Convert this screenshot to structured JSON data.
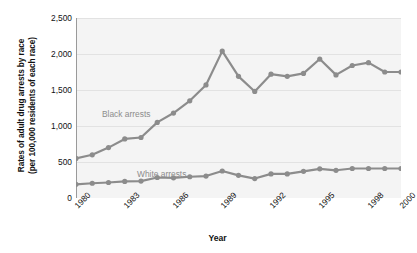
{
  "axes": {
    "y_title": "Rates of adult drug arrests by race\n(per 100,000 residents of each race)",
    "x_title": "Year",
    "y_ticks": [
      "0",
      "500",
      "1,000",
      "1,500",
      "2,000",
      "2,500"
    ],
    "x_ticks": [
      "1980",
      "1983",
      "1986",
      "1989",
      "1992",
      "1995",
      "1998",
      "2000"
    ]
  },
  "series_labels": {
    "black": "Black arrests",
    "white": "White arrests"
  },
  "colors": {
    "line": "#8c8c8c",
    "marker": "#8c8c8c",
    "plot_background": "#f4f4f4",
    "gridline": "#e2e2e2",
    "axis": "#9a9a9a",
    "text": "#111111",
    "label_text": "#8c8c8c"
  },
  "chart_data": {
    "type": "line",
    "title": "",
    "xlabel": "Year",
    "ylabel": "Rates of adult drug arrests by race (per 100,000 residents of each race)",
    "xlim": [
      1980,
      2000
    ],
    "ylim": [
      0,
      2500
    ],
    "yticks": [
      0,
      500,
      1000,
      1500,
      2000,
      2500
    ],
    "xticks": [
      1980,
      1983,
      1986,
      1989,
      1992,
      1995,
      1998,
      2000
    ],
    "grid": true,
    "legend": "inline-labels",
    "x": [
      1980,
      1981,
      1982,
      1983,
      1984,
      1985,
      1986,
      1987,
      1988,
      1989,
      1990,
      1991,
      1992,
      1993,
      1994,
      1995,
      1996,
      1997,
      1998,
      1999,
      2000
    ],
    "series": [
      {
        "name": "Black arrests",
        "values": [
          550,
          600,
          700,
          820,
          840,
          1050,
          1180,
          1350,
          1570,
          2040,
          1690,
          1480,
          1720,
          1690,
          1730,
          1930,
          1710,
          1840,
          1880,
          1750,
          1750
        ]
      },
      {
        "name": "White arrests",
        "values": [
          190,
          205,
          215,
          230,
          235,
          285,
          280,
          295,
          305,
          375,
          315,
          270,
          335,
          335,
          370,
          405,
          385,
          410,
          410,
          410,
          410
        ]
      }
    ]
  }
}
